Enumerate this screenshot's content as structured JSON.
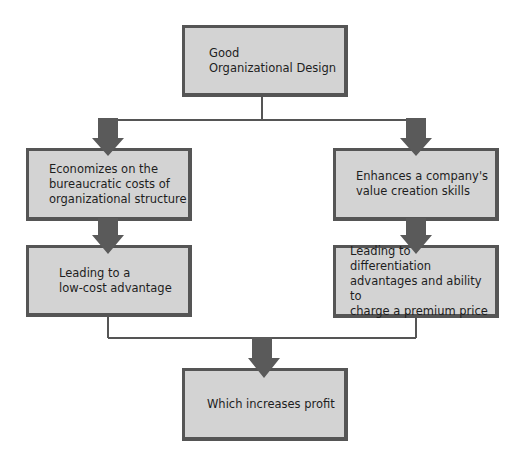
{
  "diagram": {
    "title": "Good Organizational Design",
    "nodes": {
      "root": {
        "label": "Good\nOrganizational Design"
      },
      "left_1": {
        "label": "Economizes on the\nbureaucratic costs of\norganizational structure"
      },
      "left_2": {
        "label": "Leading to a\nlow-cost advantage"
      },
      "right_1": {
        "label": "Enhances a company's\nvalue creation skills"
      },
      "right_2": {
        "label": "Leading to differentiation\nadvantages and ability to\ncharge a premium price"
      },
      "result": {
        "label": "Which increases profit"
      }
    },
    "edges": [
      {
        "from": "root",
        "to": "left_1"
      },
      {
        "from": "root",
        "to": "right_1"
      },
      {
        "from": "left_1",
        "to": "left_2"
      },
      {
        "from": "right_1",
        "to": "right_2"
      },
      {
        "from": "left_2",
        "to": "result"
      },
      {
        "from": "right_2",
        "to": "result"
      }
    ],
    "colors": {
      "box_fill": "#d3d3d3",
      "box_border": "#555555",
      "arrow": "#5a5a5a",
      "line": "#555555",
      "text": "#1e1e1e"
    }
  }
}
